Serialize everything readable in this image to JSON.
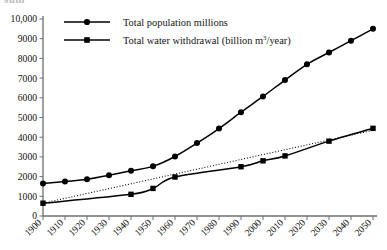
{
  "figure": {
    "clipped_heading": "sum",
    "background_color": "#ffffff",
    "ink_color": "#000000",
    "axis_color": "#6f6f6f"
  },
  "legend": {
    "position": "top-center",
    "entries": [
      {
        "label": "Total population millions",
        "marker": "circle",
        "line_style": "solid",
        "color": "#000000"
      },
      {
        "label_prefix": "Total water withdrawal (billion m",
        "label_sup": "3",
        "label_suffix": "/year)",
        "label": "Total water withdrawal (billion m3/year)",
        "marker": "square",
        "line_style": "solid",
        "color": "#000000"
      }
    ]
  },
  "chart_data": {
    "type": "line",
    "title": "",
    "subtitle": "",
    "xlabel": "",
    "ylabel": "",
    "xlim": [
      1900,
      2050
    ],
    "ylim": [
      0,
      10000
    ],
    "grid": false,
    "legend_position": "top-center",
    "x": [
      1900,
      1910,
      1920,
      1930,
      1940,
      1950,
      1960,
      1970,
      1980,
      1990,
      2000,
      2010,
      2020,
      2030,
      2040,
      2050
    ],
    "x_tick_labels": [
      "1900",
      "1910",
      "1920",
      "1930",
      "1940",
      "1950",
      "1960",
      "1970",
      "1980",
      "1990",
      "2000",
      "2010",
      "2020",
      "2030",
      "2040",
      "2050"
    ],
    "x_tick_rotation": 45,
    "y_ticks": [
      0,
      1000,
      2000,
      3000,
      4000,
      5000,
      6000,
      7000,
      8000,
      9000,
      10000
    ],
    "y_tick_labels": [
      "0",
      "1000",
      "2000",
      "3000",
      "4000",
      "5000",
      "6000",
      "7000",
      "8000",
      "9000",
      "10,000"
    ],
    "series": [
      {
        "name": "Total population millions",
        "marker": "circle",
        "line_style": "solid",
        "color": "#000000",
        "x": [
          1900,
          1910,
          1920,
          1930,
          1940,
          1950,
          1960,
          1970,
          1980,
          1990,
          2000,
          2010,
          2020,
          2030,
          2040,
          2050
        ],
        "values": [
          1650,
          1750,
          1860,
          2070,
          2300,
          2520,
          3020,
          3700,
          4440,
          5270,
          6070,
          6900,
          7700,
          8300,
          8900,
          9500
        ]
      },
      {
        "name": "Total water withdrawal (billion m3/year)",
        "marker": "square",
        "line_style": "solid",
        "color": "#000000",
        "x": [
          1900,
          1940,
          1950,
          1960,
          1990,
          2000,
          2010,
          2030,
          2050
        ],
        "values": [
          650,
          1100,
          1400,
          1980,
          2500,
          2800,
          3050,
          3800,
          4450
        ]
      },
      {
        "name": "Water withdrawal trend",
        "marker": "none",
        "line_style": "dotted",
        "color": "#000000",
        "x": [
          1900,
          2050
        ],
        "values": [
          650,
          4350
        ]
      }
    ]
  }
}
